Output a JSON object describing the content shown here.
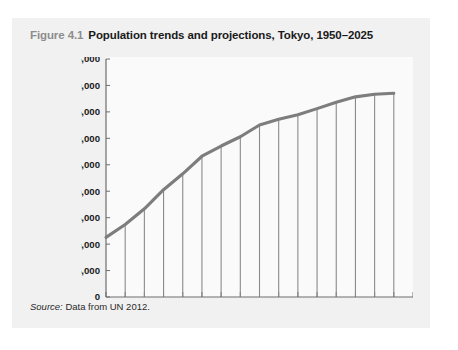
{
  "figure": {
    "number": "Figure 4.1",
    "title": "Population trends and projections, Tokyo, 1950–2025",
    "source_label": "Source:",
    "source_text": " Data from UN 2012."
  },
  "colors": {
    "card_background": "#f1f1f1",
    "plot_background": "#fafafa",
    "line": "#7d7d7d",
    "axis": "#6e6e6e",
    "drop_line": "#8a8a8a",
    "text": "#1a1a1a",
    "figure_number": "#8d8d8d"
  },
  "chart_data": {
    "type": "line",
    "title": "Population trends and projections, Tokyo, 1950–2025",
    "xlabel": "",
    "ylabel": "Urban population (thousands)",
    "xlim": [
      1950,
      2030
    ],
    "ylim": [
      0,
      45000
    ],
    "xticks": [
      1950,
      1955,
      1960,
      1965,
      1970,
      1975,
      1980,
      1985,
      1990,
      1995,
      2000,
      2005,
      2010,
      2015,
      2020,
      2025,
      2030
    ],
    "xtick_labels": [
      "1950",
      "",
      "1960",
      "",
      "1970",
      "",
      "1980",
      "",
      "1990",
      "",
      "2000",
      "",
      "2010",
      "",
      "2020",
      "",
      "2030"
    ],
    "yticks": [
      0,
      5000,
      10000,
      15000,
      20000,
      25000,
      30000,
      35000,
      40000,
      45000
    ],
    "ytick_labels": [
      "0",
      "5,000",
      "10,000",
      "15,000",
      "20,000",
      "25,000",
      "30,000",
      "35,000",
      "40,000",
      "45,000"
    ],
    "grid": false,
    "legend": "none",
    "drop_lines_at": [
      1955,
      1960,
      1965,
      1970,
      1975,
      1980,
      1985,
      1990,
      1995,
      2000,
      2005,
      2010,
      2015,
      2020,
      2025
    ],
    "x": [
      1950,
      1955,
      1960,
      1965,
      1970,
      1975,
      1980,
      1985,
      1990,
      1995,
      2000,
      2005,
      2010,
      2015,
      2020,
      2025
    ],
    "values": [
      11275,
      13713,
      16679,
      20284,
      23298,
      26615,
      28549,
      30304,
      32530,
      33587,
      34450,
      35622,
      36834,
      37843,
      38323,
      38527
    ],
    "series": [
      {
        "name": "Tokyo urban population",
        "values": [
          11275,
          13713,
          16679,
          20284,
          23298,
          26615,
          28549,
          30304,
          32530,
          33587,
          34450,
          35622,
          36834,
          37843,
          38323,
          38527
        ]
      }
    ]
  }
}
